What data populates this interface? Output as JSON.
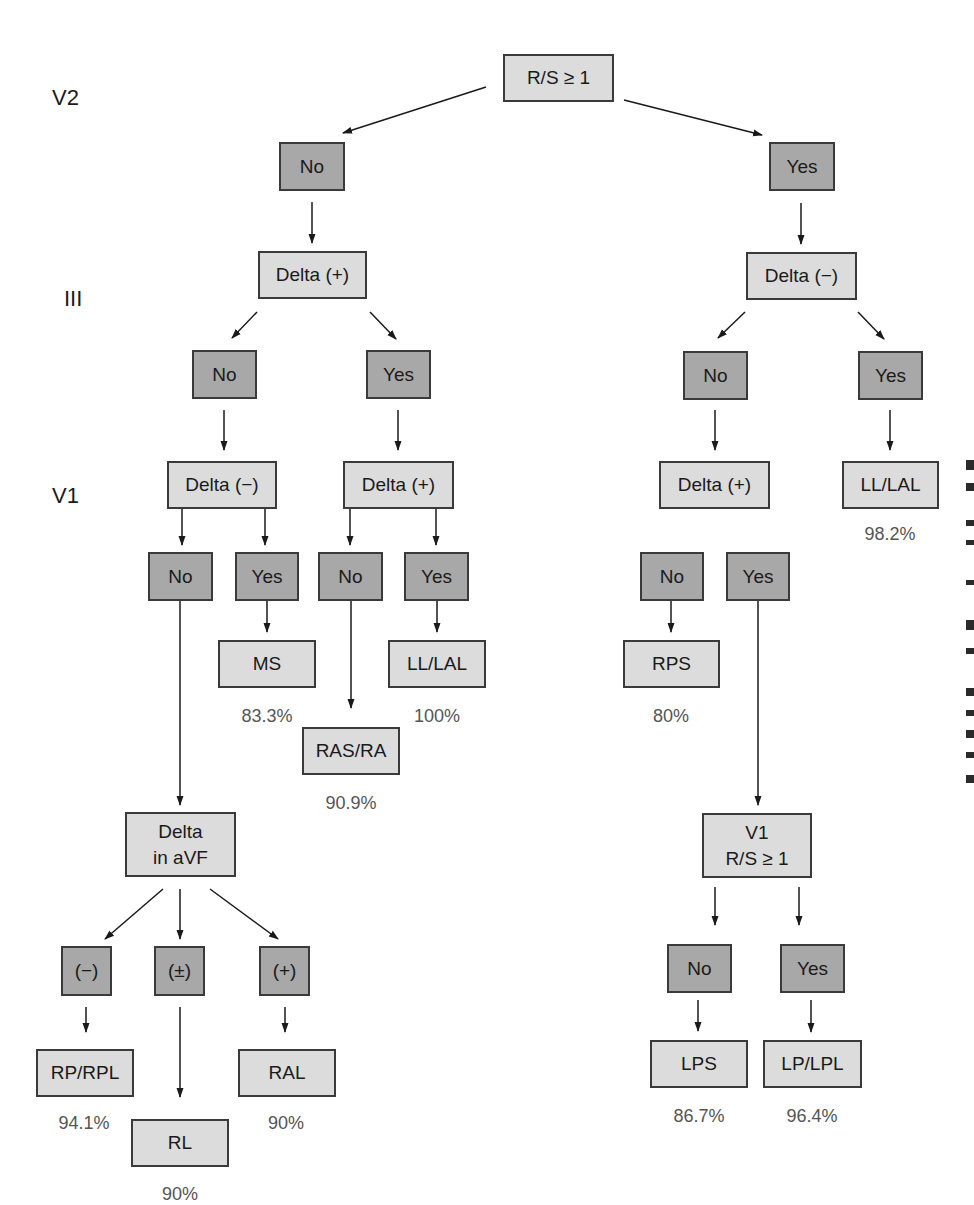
{
  "diagram": {
    "type": "decision-tree",
    "colors": {
      "condition_box": "#dcdcdc",
      "answer_box": "#a8a8a8",
      "border": "#3a3a3a",
      "percent_text": "#555555"
    },
    "row_labels": {
      "v2": "V2",
      "iii": "III",
      "v1": "V1"
    },
    "nodes": {
      "root": "R/S ≥ 1",
      "l_no": "No",
      "r_yes": "Yes",
      "l_delta_pos": "Delta (+)",
      "r_delta_neg": "Delta (−)",
      "ll_no": "No",
      "ll_yes": "Yes",
      "rl_no": "No",
      "rl_yes": "Yes",
      "ll_delta_neg": "Delta (−)",
      "ly_delta_pos": "Delta (+)",
      "rn_delta_pos": "Delta (+)",
      "ry_ll_lal": "LL/LAL",
      "a_no": "No",
      "a_yes": "Yes",
      "b_no": "No",
      "b_yes": "Yes",
      "c_no": "No",
      "c_yes": "Yes",
      "ms": "MS",
      "b_ll_lal": "LL/LAL",
      "ras_ra": "RAS/RA",
      "rps": "RPS",
      "delta_avf": "Delta\nin aVF",
      "v1_rs": "V1\nR/S ≥ 1",
      "avf_neg": "(−)",
      "avf_pm": "(±)",
      "avf_pos": "(+)",
      "d_no": "No",
      "d_yes": "Yes",
      "rp_rpl": "RP/RPL",
      "rl": "RL",
      "ral": "RAL",
      "lps": "LPS",
      "lp_lpl": "LP/LPL"
    },
    "percentages": {
      "ry_ll_lal": "98.2%",
      "ms": "83.3%",
      "b_ll_lal": "100%",
      "ras_ra": "90.9%",
      "rps": "80%",
      "rp_rpl": "94.1%",
      "rl": "90%",
      "ral": "90%",
      "lps": "86.7%",
      "lp_lpl": "96.4%"
    }
  }
}
